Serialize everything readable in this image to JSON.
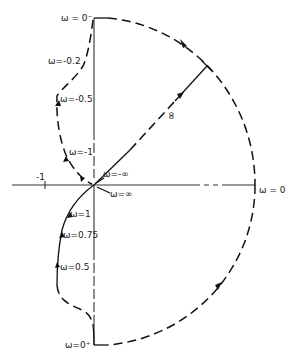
{
  "diagram": {
    "type": "nyquist-plot",
    "axes": {
      "real_tick_label": "-1",
      "origin": {
        "x": 94,
        "y": 185
      }
    },
    "contour_labels": {
      "omega_0_minus": "ω = 0⁻",
      "omega_neg_0_2": "ω=-0.2",
      "omega_neg_0_5": "ω=-0.5",
      "omega_neg_1": "ω=-1",
      "omega_neg_inf": "ω=-∞",
      "omega_inf": "ω=∞",
      "omega_1": "ω=1",
      "omega_0_75": "ω=0.75",
      "omega_0_5": "ω=0.5",
      "omega_0_plus": "ω=0⁺",
      "omega_0": "ω = 0",
      "radius_infinity": "∞"
    }
  }
}
